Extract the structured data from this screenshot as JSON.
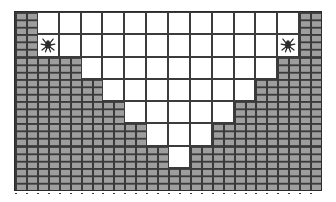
{
  "scene": {
    "title": "Dungeon Cavern Map",
    "kind": "tile-grid-map",
    "width_px": 336,
    "height_px": 202
  },
  "map": {
    "columns": 14,
    "rows": 8,
    "cell_size_px": 22,
    "origin_x_px": 14,
    "origin_y_px": 11,
    "tile_legend": {
      "wall": "brick-wall-tile",
      "open": "open-floor-tile"
    },
    "colors": {
      "brick_fill": "#9e9e9e",
      "brick_mortar": "#3a3a3a",
      "floor_fill": "#ffffff",
      "grid_line": "#3c3c3c",
      "frame_border": "#2b2b2b",
      "creature": "#2a2a2a",
      "background": "#ffffff"
    },
    "grid": [
      [
        "wall",
        "open",
        "open",
        "open",
        "open",
        "open",
        "open",
        "open",
        "open",
        "open",
        "open",
        "open",
        "open",
        "wall"
      ],
      [
        "wall",
        "open",
        "open",
        "open",
        "open",
        "open",
        "open",
        "open",
        "open",
        "open",
        "open",
        "open",
        "open",
        "wall"
      ],
      [
        "wall",
        "wall",
        "wall",
        "open",
        "open",
        "open",
        "open",
        "open",
        "open",
        "open",
        "open",
        "open",
        "wall",
        "wall"
      ],
      [
        "wall",
        "wall",
        "wall",
        "wall",
        "open",
        "open",
        "open",
        "open",
        "open",
        "open",
        "open",
        "wall",
        "wall",
        "wall"
      ],
      [
        "wall",
        "wall",
        "wall",
        "wall",
        "wall",
        "open",
        "open",
        "open",
        "open",
        "open",
        "wall",
        "wall",
        "wall",
        "wall"
      ],
      [
        "wall",
        "wall",
        "wall",
        "wall",
        "wall",
        "wall",
        "open",
        "open",
        "open",
        "wall",
        "wall",
        "wall",
        "wall",
        "wall"
      ],
      [
        "wall",
        "wall",
        "wall",
        "wall",
        "wall",
        "wall",
        "wall",
        "open",
        "wall",
        "wall",
        "wall",
        "wall",
        "wall",
        "wall"
      ],
      [
        "wall",
        "wall",
        "wall",
        "wall",
        "wall",
        "wall",
        "wall",
        "wall",
        "wall",
        "wall",
        "wall",
        "wall",
        "wall",
        "wall"
      ]
    ],
    "creatures": [
      {
        "name": "creature-left",
        "row": 1,
        "col": 1,
        "icon": "spider-icon"
      },
      {
        "name": "creature-right",
        "row": 1,
        "col": 12,
        "icon": "spider-icon"
      }
    ]
  }
}
